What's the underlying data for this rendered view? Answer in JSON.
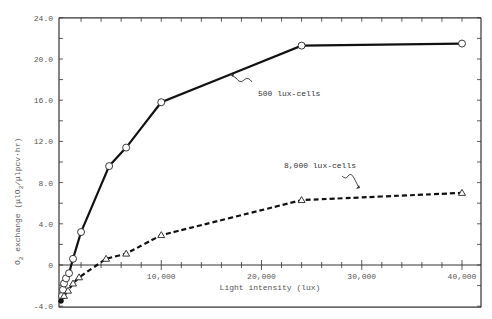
{
  "chart_data": {
    "type": "line",
    "title": "",
    "xlabel": "Light intensity (lux)",
    "ylabel": "O2 exchange (μlO2/μlpcv·hr)",
    "xlim": [
      0,
      41000
    ],
    "ylim": [
      -4.0,
      24.0
    ],
    "x_ticks": [
      0,
      10000,
      20000,
      30000,
      40000
    ],
    "x_tick_labels": [
      "",
      "10,000",
      "20,000",
      "30,000",
      "40,000"
    ],
    "y_ticks": [
      -4.0,
      0,
      4.0,
      8.0,
      12.0,
      16.0,
      20.0,
      24.0
    ],
    "y_tick_labels": [
      "-4.0",
      "0",
      "4.0",
      "8.0",
      "12.0",
      "16.0",
      "20.0",
      "24.0"
    ],
    "grid": false,
    "series": [
      {
        "name": "500 lux-cells",
        "marker": "circle",
        "line_style": "solid",
        "x": [
          0,
          100,
          200,
          300,
          500,
          800,
          1200,
          2000,
          4800,
          6500,
          10000,
          24000,
          40000
        ],
        "y": [
          -3.5,
          -3.0,
          -2.4,
          -1.8,
          -1.3,
          -0.8,
          0.6,
          3.2,
          9.6,
          11.4,
          15.8,
          21.3,
          21.5
        ]
      },
      {
        "name": "8,000 lux-cells",
        "marker": "triangle",
        "line_style": "dashed",
        "x": [
          0,
          300,
          700,
          1200,
          1800,
          4500,
          6500,
          10000,
          24000,
          40000
        ],
        "y": [
          -3.5,
          -3.0,
          -2.5,
          -1.8,
          -1.2,
          0.6,
          1.1,
          2.9,
          6.3,
          7.0
        ]
      }
    ],
    "annotations": [
      {
        "text": "500 lux-cells",
        "points_to": "500 lux-cells"
      },
      {
        "text": "8,000 lux-cells",
        "points_to": "8,000 lux-cells"
      }
    ]
  },
  "labels": {
    "xlabel": "Light intensity (lux)",
    "ylabel_main": "O",
    "ylabel_sub": "2",
    "ylabel_rest": " exchange (μlO",
    "ylabel_sub2": "2",
    "ylabel_end": "/μlpcv·hr)",
    "annot_500": "500 lux-cells",
    "annot_8000": "8,000 lux-cells"
  }
}
